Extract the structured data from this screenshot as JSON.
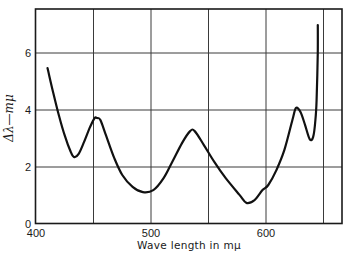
{
  "chart_data": {
    "type": "line",
    "title": "",
    "xlabel": "Wave length in mμ",
    "ylabel": "Δλ—mμ",
    "xlim": [
      400,
      668
    ],
    "ylim": [
      0,
      7.5
    ],
    "x_ticks": [
      400,
      500,
      600
    ],
    "x_tick_labels": [
      "400",
      "500",
      "600"
    ],
    "x_gridlines": [
      450,
      500,
      550,
      600,
      650
    ],
    "y_ticks": [
      0,
      2,
      4,
      6
    ],
    "y_tick_labels": [
      "0",
      "2",
      "4",
      "6"
    ],
    "grid": true,
    "legend": null,
    "series": [
      {
        "name": "Δλ",
        "color": "#111111",
        "x": [
          410,
          415,
          420,
          425,
          430,
          433,
          437,
          442,
          447,
          451,
          453,
          456,
          461,
          468,
          475,
          484,
          493,
          502,
          511,
          518,
          527,
          534,
          538,
          546,
          555,
          565,
          577,
          583,
          590,
          597,
          602,
          609,
          616,
          623,
          626,
          630,
          634,
          638,
          641,
          643,
          644,
          645,
          645
        ],
        "y": [
          5.47,
          4.6,
          3.8,
          3.1,
          2.55,
          2.35,
          2.45,
          2.9,
          3.4,
          3.72,
          3.72,
          3.65,
          3.1,
          2.32,
          1.72,
          1.3,
          1.12,
          1.19,
          1.61,
          2.14,
          2.84,
          3.26,
          3.26,
          2.77,
          2.18,
          1.61,
          1.02,
          0.74,
          0.84,
          1.19,
          1.37,
          1.89,
          2.6,
          3.65,
          4.07,
          3.93,
          3.47,
          2.98,
          3.05,
          3.65,
          4.35,
          6.04,
          6.98
        ]
      }
    ]
  }
}
